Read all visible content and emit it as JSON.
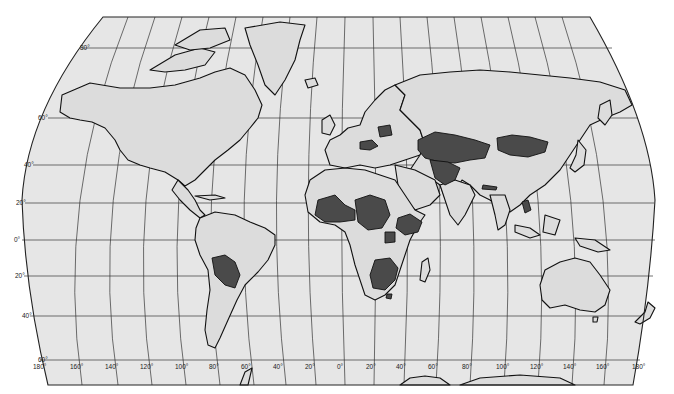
{
  "map": {
    "projection": "Robinson-like world map",
    "colors": {
      "ocean": "#e6e6e6",
      "land": "#dcdcdc",
      "highlighted": "#4a4a4a",
      "outline": "#111111"
    },
    "latitude_labels": [
      "80°",
      "60°",
      "40°",
      "20°",
      "0°",
      "20°",
      "40°",
      "60°"
    ],
    "longitude_labels": [
      "180°",
      "160°",
      "140°",
      "120°",
      "100°",
      "80°",
      "60°",
      "40°",
      "20°",
      "0°",
      "20°",
      "40°",
      "60°",
      "80°",
      "100°",
      "120°",
      "140°",
      "160°",
      "180°"
    ],
    "highlighted_regions": [
      "Bolivia",
      "Mali",
      "Niger",
      "Chad",
      "Burkina Faso",
      "Central African Republic",
      "Ethiopia",
      "South Sudan",
      "Zambia",
      "Zimbabwe",
      "Botswana",
      "Malawi",
      "Lesotho",
      "Belarus",
      "Czechia/Austria/Hungary",
      "Kazakhstan",
      "Uzbekistan",
      "Afghanistan",
      "Mongolia",
      "Nepal",
      "Laos"
    ]
  }
}
